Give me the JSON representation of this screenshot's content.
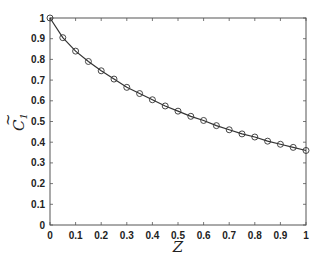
{
  "chart_data": {
    "type": "line",
    "title": "",
    "xlabel": "Z",
    "ylabel": "C̃1",
    "xlim": [
      0,
      1
    ],
    "ylim": [
      0,
      1
    ],
    "grid": false,
    "legend": null,
    "x_ticks": [
      "0",
      "0.1",
      "0.2",
      "0.3",
      "0.4",
      "0.5",
      "0.6",
      "0.7",
      "0.8",
      "0.9",
      "1"
    ],
    "y_ticks": [
      "0",
      "0.1",
      "0.2",
      "0.3",
      "0.4",
      "0.5",
      "0.6",
      "0.7",
      "0.8",
      "0.9",
      "1"
    ],
    "series": [
      {
        "name": "C1",
        "marker": "circle",
        "color": "#333333",
        "x": [
          0,
          0.05,
          0.1,
          0.15,
          0.2,
          0.25,
          0.3,
          0.35,
          0.4,
          0.45,
          0.5,
          0.55,
          0.6,
          0.65,
          0.7,
          0.75,
          0.8,
          0.85,
          0.9,
          0.95,
          1.0
        ],
        "values": [
          1.0,
          0.905,
          0.84,
          0.79,
          0.745,
          0.705,
          0.665,
          0.635,
          0.605,
          0.575,
          0.55,
          0.525,
          0.505,
          0.48,
          0.46,
          0.44,
          0.425,
          0.405,
          0.39,
          0.375,
          0.36
        ]
      }
    ]
  }
}
